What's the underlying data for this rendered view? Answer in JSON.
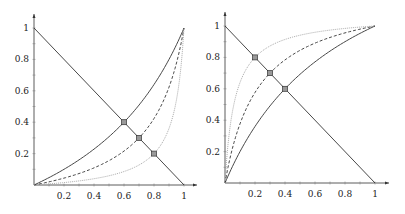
{
  "chart_data": [
    {
      "type": "line",
      "title": "",
      "xlabel": "",
      "ylabel": "",
      "xlim": [
        0,
        1
      ],
      "ylim": [
        0,
        1
      ],
      "grid": false,
      "x_ticks": [
        "0.2",
        "0.4",
        "0.6",
        "0.8",
        "1"
      ],
      "y_ticks": [
        "0.2",
        "0.4",
        "0.6",
        "0.8",
        "1"
      ],
      "pixel_frame": {
        "x0": 34,
        "y0": 185,
        "x1": 184,
        "y1": 28,
        "arrow_x": 197,
        "arrow_y": 14
      },
      "series": [
        {
          "name": "diagonal",
          "style": "solid",
          "color": "#333333",
          "formula": "1-x"
        },
        {
          "name": "curve-a",
          "style": "solid",
          "color": "#333333",
          "c": 0.4444,
          "intersection": [
            0.6,
            0.4
          ]
        },
        {
          "name": "curve-b",
          "style": "dashed",
          "color": "#333333",
          "c": 0.1837,
          "intersection": [
            0.7,
            0.3
          ]
        },
        {
          "name": "curve-c",
          "style": "dotted",
          "color": "#aaaaaa",
          "c": 0.0625,
          "intersection": [
            0.8,
            0.2
          ]
        }
      ],
      "markers": [
        [
          0.6,
          0.4
        ],
        [
          0.7,
          0.3
        ],
        [
          0.8,
          0.2
        ]
      ]
    },
    {
      "type": "line",
      "title": "",
      "xlabel": "",
      "ylabel": "",
      "xlim": [
        0,
        1
      ],
      "ylim": [
        0,
        1
      ],
      "grid": false,
      "x_ticks": [
        "0.2",
        "0.4",
        "0.6",
        "0.8",
        "1"
      ],
      "y_ticks": [
        "0.2",
        "0.4",
        "0.6",
        "0.8",
        "1"
      ],
      "pixel_frame": {
        "x0": 225,
        "y0": 183,
        "x1": 375,
        "y1": 26,
        "arrow_x": 389,
        "arrow_y": 12
      },
      "series": [
        {
          "name": "diagonal",
          "style": "solid",
          "color": "#333333",
          "formula": "1-x"
        },
        {
          "name": "curve-a",
          "style": "solid",
          "color": "#333333",
          "c": 2.25,
          "intersection": [
            0.4,
            0.6
          ]
        },
        {
          "name": "curve-b",
          "style": "dashed",
          "color": "#333333",
          "c": 5.444,
          "intersection": [
            0.3,
            0.7
          ]
        },
        {
          "name": "curve-c",
          "style": "dotted",
          "color": "#aaaaaa",
          "c": 16,
          "intersection": [
            0.2,
            0.8
          ]
        }
      ],
      "markers": [
        [
          0.4,
          0.6
        ],
        [
          0.3,
          0.7
        ],
        [
          0.2,
          0.8
        ]
      ]
    }
  ]
}
